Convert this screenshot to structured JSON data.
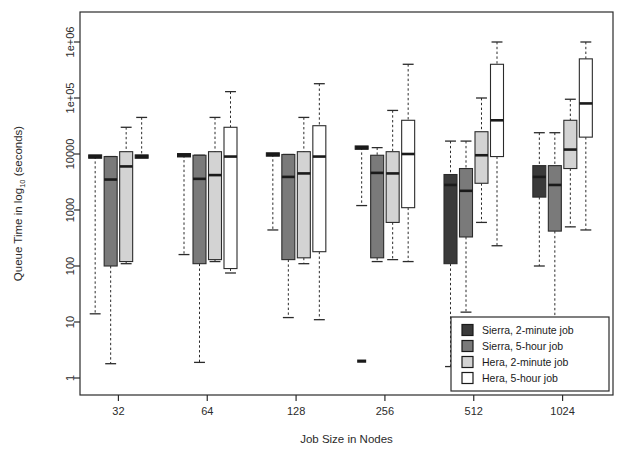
{
  "chart_data": {
    "type": "box",
    "title": "",
    "xlabel": "Job Size in Nodes",
    "ylabel_parts": {
      "pre": "Queue Time in log",
      "sub": "10",
      "post": " (seconds)"
    },
    "ylabel": "Queue Time in log10 (seconds)",
    "categories": [
      "32",
      "64",
      "128",
      "256",
      "512",
      "1024"
    ],
    "yscale": "log",
    "ylim": [
      1,
      3000000
    ],
    "yticks": [
      1,
      10,
      100,
      1000,
      10000,
      100000,
      1000000
    ],
    "ytick_labels": [
      "1",
      "10",
      "100",
      "1000",
      "10000",
      "1e+05",
      "1e+06"
    ],
    "grid": false,
    "legend_position": "bottom-right",
    "series": [
      {
        "name": "Sierra, 2-minute job",
        "fill": "#3a3a3a",
        "boxes": [
          {
            "category": "32",
            "whislo": 14,
            "q1": 9000,
            "med": 9000,
            "q3": 9000,
            "whishi": 9000,
            "degenerate": true
          },
          {
            "category": "64",
            "whislo": 160,
            "q1": 9500,
            "med": 9500,
            "q3": 9500,
            "whishi": 9500,
            "degenerate": true
          },
          {
            "category": "128",
            "whislo": 440,
            "q1": 9800,
            "med": 9800,
            "q3": 9800,
            "whishi": 9800,
            "degenerate": true
          },
          {
            "category": "256",
            "whislo": 1200,
            "q1": 13000,
            "med": 13000,
            "q3": 13000,
            "whishi": 13000,
            "degenerate": true,
            "outliers": [
              2
            ]
          },
          {
            "category": "512",
            "whislo": 1.6,
            "q1": 110,
            "med": 2800,
            "q3": 4300,
            "whishi": 17000
          },
          {
            "category": "1024",
            "whislo": 100,
            "q1": 1700,
            "med": 3900,
            "q3": 6200,
            "whishi": 24000
          }
        ]
      },
      {
        "name": "Sierra, 5-hour job",
        "fill": "#7a7a7a",
        "boxes": [
          {
            "category": "32",
            "whislo": 1.8,
            "q1": 100,
            "med": 3500,
            "q3": 9000,
            "whishi": 9000,
            "degenerate": true
          },
          {
            "category": "64",
            "whislo": 1.9,
            "q1": 110,
            "med": 3600,
            "q3": 9500,
            "whishi": 9500,
            "degenerate": true
          },
          {
            "category": "128",
            "whislo": 12,
            "q1": 130,
            "med": 3900,
            "q3": 9800,
            "whishi": 9800,
            "degenerate": true
          },
          {
            "category": "256",
            "whislo": 120,
            "q1": 140,
            "med": 4600,
            "q3": 9500,
            "whishi": 13000,
            "degenerate": true
          },
          {
            "category": "512",
            "whislo": 15,
            "q1": 330,
            "med": 2200,
            "q3": 5500,
            "whishi": 17000
          },
          {
            "category": "1024",
            "whislo": 5,
            "q1": 420,
            "med": 2800,
            "q3": 6200,
            "whishi": 24000
          }
        ]
      },
      {
        "name": "Hera, 2-minute job",
        "fill": "#d3d3d3",
        "boxes": [
          {
            "category": "32",
            "whislo": 110,
            "q1": 120,
            "med": 6000,
            "q3": 11000,
            "whishi": 30000
          },
          {
            "category": "64",
            "whislo": 120,
            "q1": 130,
            "med": 4200,
            "q3": 11000,
            "whishi": 45000
          },
          {
            "category": "128",
            "whislo": 110,
            "q1": 140,
            "med": 4500,
            "q3": 11000,
            "whishi": 45000
          },
          {
            "category": "256",
            "whislo": 130,
            "q1": 600,
            "med": 4500,
            "q3": 11000,
            "whishi": 60000
          },
          {
            "category": "512",
            "whislo": 600,
            "q1": 3000,
            "med": 9500,
            "q3": 25000,
            "whishi": 100000
          },
          {
            "category": "1024",
            "whislo": 500,
            "q1": 5500,
            "med": 12000,
            "q3": 40000,
            "whishi": 95000
          }
        ]
      },
      {
        "name": "Hera, 5-hour job",
        "fill": "#ffffff",
        "boxes": [
          {
            "category": "32",
            "whislo": 9000,
            "q1": 9000,
            "med": 9000,
            "q3": 9000,
            "whishi": 45000,
            "degenerate": true
          },
          {
            "category": "64",
            "whislo": 75,
            "q1": 90,
            "med": 9000,
            "q3": 30000,
            "whishi": 130000
          },
          {
            "category": "128",
            "whislo": 11,
            "q1": 180,
            "med": 9000,
            "q3": 32000,
            "whishi": 180000
          },
          {
            "category": "256",
            "whislo": 120,
            "q1": 1100,
            "med": 10000,
            "q3": 40000,
            "whishi": 400000
          },
          {
            "category": "512",
            "whislo": 230,
            "q1": 9000,
            "med": 40000,
            "q3": 400000,
            "whishi": 1000000
          },
          {
            "category": "1024",
            "whislo": 440,
            "q1": 20000,
            "med": 80000,
            "q3": 500000,
            "whishi": 1000000
          }
        ]
      }
    ]
  },
  "legend": {
    "items": [
      {
        "label": "Sierra, 2-minute job",
        "swatch": "#3a3a3a"
      },
      {
        "label": "Sierra, 5-hour job",
        "swatch": "#7a7a7a"
      },
      {
        "label": "Hera, 2-minute job",
        "swatch": "#d3d3d3"
      },
      {
        "label": "Hera, 5-hour job",
        "swatch": "#ffffff"
      }
    ]
  }
}
